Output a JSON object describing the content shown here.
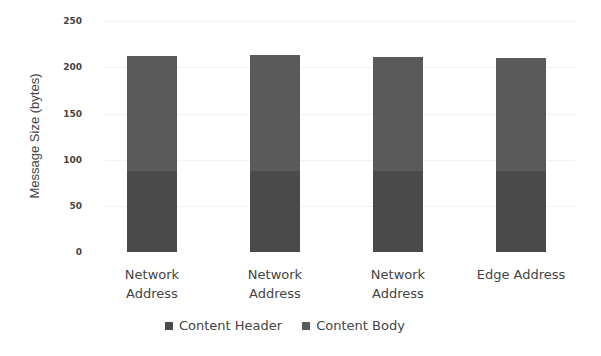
{
  "chart_data": {
    "type": "bar",
    "stacked": true,
    "title": "",
    "xlabel": "",
    "ylabel": "Message Size (bytes)",
    "ylim": [
      0,
      250
    ],
    "yticks": [
      0,
      50,
      100,
      150,
      200,
      250
    ],
    "grid": true,
    "legend_position": "bottom",
    "categories": [
      "Network\nAddress",
      "Network\nAddress",
      "Network\nAddress",
      "Edge Address"
    ],
    "series": [
      {
        "name": "Content Header",
        "color": "#4a4a4a",
        "values": [
          88,
          88,
          88,
          88
        ]
      },
      {
        "name": "Content Body",
        "color": "#5a5a5a",
        "values": [
          124,
          125,
          123,
          122
        ]
      }
    ]
  },
  "axis": {
    "ylabel": "Message Size (bytes)",
    "ticks": [
      "0",
      "50",
      "100",
      "150",
      "200",
      "250"
    ]
  },
  "legend": {
    "header_label": "Content Header",
    "body_label": "Content Body"
  },
  "xlabels": [
    "Network\nAddress",
    "Network\nAddress",
    "Network\nAddress",
    "Edge Address"
  ]
}
